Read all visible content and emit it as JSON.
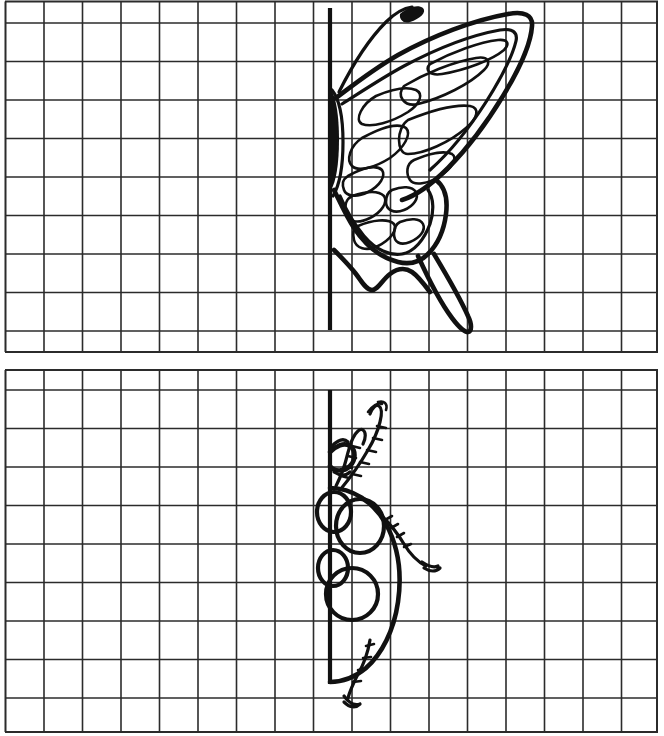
{
  "worksheet": {
    "title": "Symmetry Drawing Worksheet",
    "description": "Two squared grids, each with a bold vertical mirror line; half of an insect is drawn on the right of the line to be completed on the left.",
    "background_color": "#ffffff",
    "ink_color": "#111111",
    "grid_color": "#2b2b2b"
  },
  "grid": {
    "columns": 17,
    "rows_top_panel": 9,
    "rows_bottom_panel": 9,
    "cell_size_px": 38.5,
    "left_edge_px": 5,
    "right_edge_px": 658
  },
  "panels": [
    {
      "id": "panel-butterfly",
      "label": "Butterfly half",
      "top_px": 0,
      "height_px": 356,
      "mirror_line": {
        "label": "vertical mirror line",
        "x_px": 330,
        "y_start_px": 8,
        "y_end_px": 330,
        "stroke_width_px": 4.2
      },
      "figure": {
        "name": "butterfly-half",
        "subject": "butterfly",
        "side_drawn": "right",
        "parts": [
          "antenna with clubbed tip",
          "body along mirror line",
          "upper forewing with cell markings",
          "lower hindwing with cell markings",
          "long trailing tail"
        ]
      }
    },
    {
      "id": "panel-ladybug",
      "label": "Ladybug half",
      "top_px": 368,
      "height_px": 368,
      "mirror_line": {
        "label": "vertical mirror line",
        "x_px": 330,
        "y_start_px": 22,
        "y_end_px": 316,
        "stroke_width_px": 4.2
      },
      "figure": {
        "name": "ladybug-half",
        "subject": "ladybug",
        "side_drawn": "right",
        "parts": [
          "two segmented antennae",
          "head and pronotum",
          "domed elytron body",
          "three spots",
          "two segmented legs"
        ],
        "spot_count": 3
      }
    }
  ]
}
